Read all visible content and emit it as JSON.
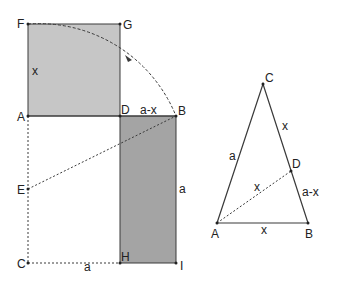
{
  "colors": {
    "square_fill": "#c6c6c6",
    "rect_fill": "#a4a4a4",
    "stroke": "#3a3a3a"
  },
  "figure1": {
    "points": {
      "F": {
        "label": "F",
        "x": 28,
        "y": 24
      },
      "G": {
        "label": "G",
        "x": 120,
        "y": 24
      },
      "A": {
        "label": "A",
        "x": 28,
        "y": 116
      },
      "D": {
        "label": "D",
        "x": 120,
        "y": 116
      },
      "B": {
        "label": "B",
        "x": 176,
        "y": 116
      },
      "E": {
        "label": "E",
        "x": 28,
        "y": 189
      },
      "C": {
        "label": "C",
        "x": 28,
        "y": 263
      },
      "H": {
        "label": "H",
        "x": 120,
        "y": 263
      },
      "I": {
        "label": "I",
        "x": 176,
        "y": 263
      }
    },
    "segment_labels": {
      "AF": "x",
      "DB": "a-x",
      "BI": "a",
      "CH": "a"
    }
  },
  "figure2": {
    "points": {
      "A": {
        "label": "A",
        "x": 217,
        "y": 223
      },
      "B": {
        "label": "B",
        "x": 308,
        "y": 223
      },
      "C": {
        "label": "C",
        "x": 263,
        "y": 84
      },
      "D": {
        "label": "D",
        "x": 291,
        "y": 171
      }
    },
    "segment_labels": {
      "AC": "a",
      "CD": "x",
      "DB": "a-x",
      "AD": "x",
      "AB": "x"
    }
  }
}
